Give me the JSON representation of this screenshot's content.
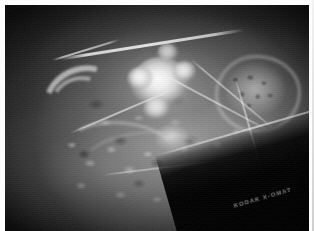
{
  "image": {
    "kind": "radiograph",
    "modality": "X-ray",
    "orientation": "lateral",
    "caption": "Lateral radiograph showing a large irregular lobulated high-density calcified mass in the mid-field, overlying mottled trabecular bone, with a dark diagonal collimation edge across the lower right corner",
    "frame": {
      "border_color": "#fdfdfd",
      "background_color": "#000000",
      "border_width_px": 5
    }
  },
  "film": {
    "edge_label": "KODAK X-OMAT",
    "edge_label_visible": true,
    "collimation_edge": "lower-right diagonal"
  },
  "findings": [
    {
      "name": "dense-calcified-mass",
      "region": "central",
      "density": "high",
      "margin": "lobulated-irregular"
    },
    {
      "name": "secondary-dense-focus",
      "region": "inferior-to-main-mass",
      "density": "moderate-high",
      "margin": "ill-defined"
    },
    {
      "name": "osseous-cluster",
      "region": "right",
      "density": "moderate",
      "margin": "corticated"
    },
    {
      "name": "curved-cortical-arc",
      "region": "left",
      "density": "moderate",
      "margin": "smooth"
    },
    {
      "name": "linear-opacity",
      "region": "superior",
      "density": "high",
      "margin": "linear"
    },
    {
      "name": "trabecular-bone-texture",
      "region": "inferior-central",
      "density": "low-moderate",
      "margin": "mottled"
    }
  ],
  "palette": {
    "mount": "#fdfdfd",
    "backdrop": "#000000",
    "mass_highlight": "#ffffff",
    "soft_tissue": "#8a8a8a",
    "bone": "#cfcfcf"
  }
}
